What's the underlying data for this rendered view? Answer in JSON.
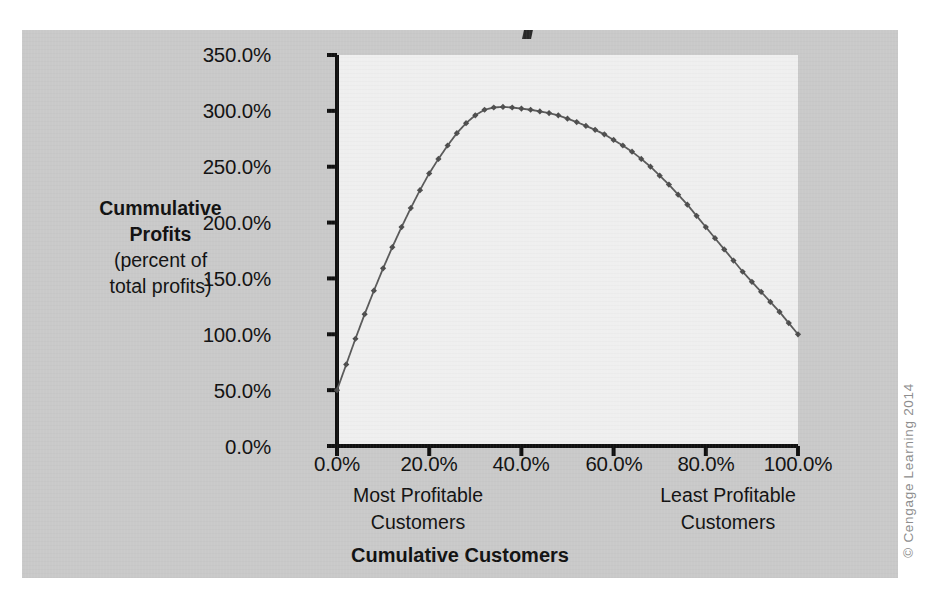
{
  "figure": {
    "background_color": "#c9c9c9",
    "plot_background_color": "#efefef",
    "line_color": "#595959",
    "axis_color": "#101010"
  },
  "copyright": "© Cengage Learning 2014",
  "y_axis_title": {
    "line1": "Cummulative",
    "line2": "Profits",
    "line3": "(percent of",
    "line4": "total profits)"
  },
  "x_axis_title": "Cumulative Customers",
  "x_notes": {
    "left_line1": "Most Profitable",
    "left_line2": "Customers",
    "right_line1": "Least Profitable",
    "right_line2": "Customers"
  },
  "chart_data": {
    "type": "line",
    "title": "",
    "xlabel": "Cumulative Customers",
    "ylabel": "Cummulative Profits (percent of total profits)",
    "xlim": [
      0,
      100
    ],
    "ylim": [
      0,
      350
    ],
    "grid": false,
    "legend": "none",
    "marker": "diamond",
    "xtick_labels": [
      "0.0%",
      "20.0%",
      "40.0%",
      "60.0%",
      "80.0%",
      "100.0%"
    ],
    "xticks": [
      0,
      20,
      40,
      60,
      80,
      100
    ],
    "ytick_labels": [
      "0.0%",
      "50.0%",
      "100.0%",
      "150.0%",
      "200.0%",
      "250.0%",
      "300.0%",
      "350.0%"
    ],
    "yticks": [
      0,
      50,
      100,
      150,
      200,
      250,
      300,
      350
    ],
    "annotations": [
      "Most Profitable Customers",
      "Least Profitable Customers"
    ],
    "series": [
      {
        "name": "Cumulative Profits",
        "x": [
          0,
          2,
          4,
          6,
          8,
          10,
          12,
          14,
          16,
          18,
          20,
          22,
          24,
          26,
          28,
          30,
          32,
          34,
          36,
          38,
          40,
          42,
          44,
          46,
          48,
          50,
          52,
          54,
          56,
          58,
          60,
          62,
          64,
          66,
          68,
          70,
          72,
          74,
          76,
          78,
          80,
          82,
          84,
          86,
          88,
          90,
          92,
          94,
          96,
          98,
          100
        ],
        "values": [
          50,
          73,
          96,
          118,
          139,
          159,
          178,
          196,
          213,
          229,
          244,
          257,
          269,
          280,
          289,
          296,
          301,
          303,
          303.5,
          303,
          302,
          301,
          299.5,
          298,
          296,
          293,
          290,
          286.5,
          283,
          279,
          274,
          269,
          263.5,
          257,
          250,
          242,
          234,
          225,
          216,
          206,
          196,
          186,
          176,
          166,
          156,
          147,
          138,
          129,
          120,
          110,
          100
        ]
      }
    ]
  }
}
